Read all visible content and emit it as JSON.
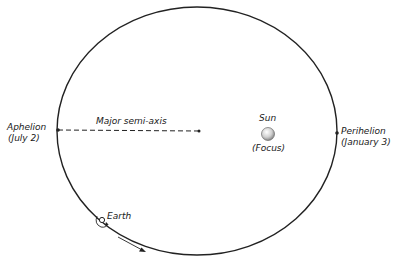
{
  "diagram": {
    "labels": {
      "aphelion": "Aphelion",
      "aphelion_date": "(July 2)",
      "perihelion": "Perihelion",
      "perihelion_date": "(January 3)",
      "major_semi_axis": "Major semi-axis",
      "sun": "Sun",
      "focus": "(Focus)",
      "earth": "Earth"
    },
    "colors": {
      "orbit": "#222222",
      "sun_fill": "#d9d9d9",
      "background": "#ffffff"
    }
  }
}
